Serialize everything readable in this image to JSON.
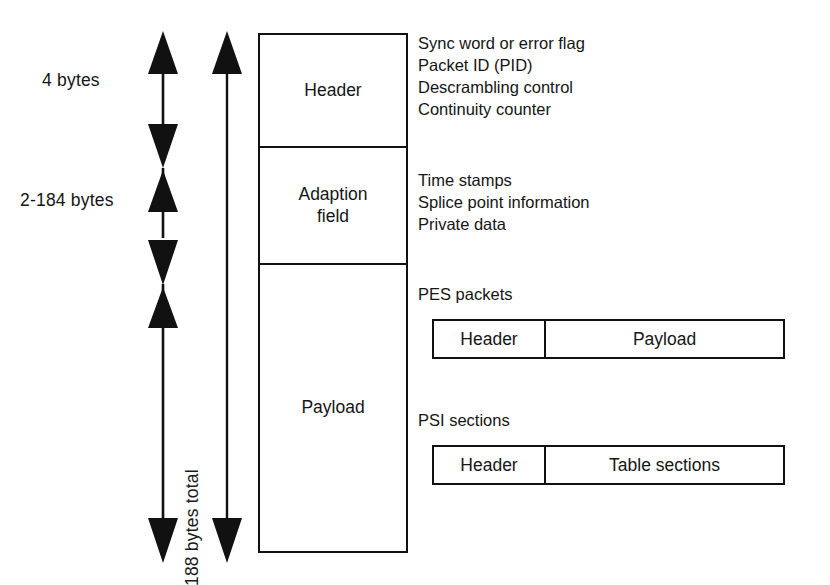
{
  "diagram": {
    "dimensions": {
      "header_size": "4 bytes",
      "adaption_field_size": "2-184 bytes",
      "total_size": "188 bytes total"
    },
    "packet_cells": [
      {
        "label": "Header"
      },
      {
        "label": "Adaption\nfield"
      },
      {
        "label": "Payload"
      }
    ],
    "header_contents": [
      "Sync word or error flag",
      "Packet ID (PID)",
      "Descrambling control",
      "Continuity counter"
    ],
    "adaption_contents": [
      "Time stamps",
      "Splice point information",
      "Private data"
    ],
    "payload_variants": [
      {
        "title": "PES packets",
        "cells": [
          {
            "label": "Header"
          },
          {
            "label": "Payload"
          }
        ]
      },
      {
        "title": "PSI sections",
        "cells": [
          {
            "label": "Header"
          },
          {
            "label": "Table sections"
          }
        ]
      }
    ],
    "colors": {
      "line": "#111111",
      "text": "#151515",
      "background": "#ffffff"
    }
  }
}
